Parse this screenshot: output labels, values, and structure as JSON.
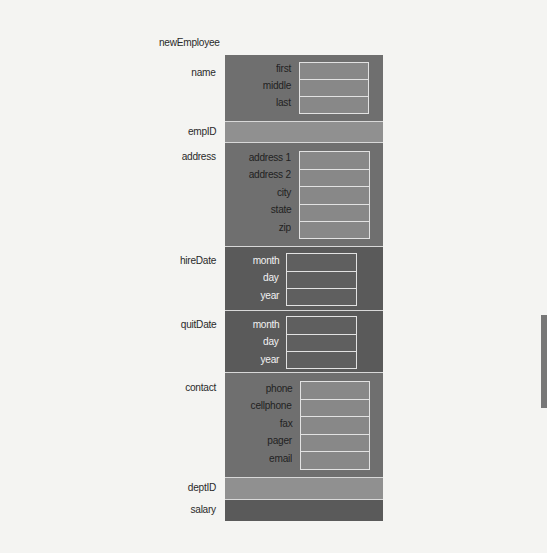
{
  "diagram": {
    "root_label": "newEmployee",
    "colors": {
      "background": "#f4f4f2",
      "section_mid": "#6f6f6f",
      "section_light": "#909090",
      "section_dark": "#5a5a5a",
      "field_border": "#e2e2e2",
      "side_tab": "#777777"
    },
    "sections": [
      {
        "name": "name",
        "fields": [
          "first",
          "middle",
          "last"
        ]
      },
      {
        "name": "empID",
        "fields": []
      },
      {
        "name": "address",
        "fields": [
          "address 1",
          "address 2",
          "city",
          "state",
          "zip"
        ]
      },
      {
        "name": "hireDate",
        "fields": [
          "month",
          "day",
          "year"
        ]
      },
      {
        "name": "quitDate",
        "fields": [
          "month",
          "day",
          "year"
        ]
      },
      {
        "name": "contact",
        "fields": [
          "phone",
          "cellphone",
          "fax",
          "pager",
          "email"
        ]
      },
      {
        "name": "deptID",
        "fields": []
      },
      {
        "name": "salary",
        "fields": []
      }
    ]
  }
}
